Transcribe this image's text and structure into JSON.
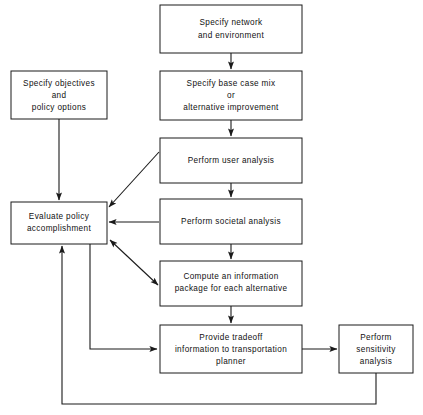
{
  "diagram": {
    "background_color": "#ffffff",
    "line_color": "#1a1a1a",
    "nodes": [
      {
        "id": "specify-network",
        "lines": [
          "Specify network",
          "and environment"
        ],
        "x": 160,
        "y": 5,
        "w": 142,
        "h": 48
      },
      {
        "id": "specify-base-case",
        "lines": [
          "Specify base case mix",
          "or",
          "alternative improvement"
        ],
        "x": 160,
        "y": 71,
        "w": 142,
        "h": 49
      },
      {
        "id": "specify-objectives",
        "lines": [
          "Specify objectives",
          "and",
          "policy options"
        ],
        "x": 11,
        "y": 71,
        "w": 96,
        "h": 48
      },
      {
        "id": "perform-user-analysis",
        "lines": [
          "Perform user analysis"
        ],
        "x": 160,
        "y": 138,
        "w": 142,
        "h": 45
      },
      {
        "id": "evaluate-policy",
        "lines": [
          "Evaluate policy",
          "accomplishment"
        ],
        "x": 11,
        "y": 202,
        "w": 96,
        "h": 42
      },
      {
        "id": "perform-societal-analysis",
        "lines": [
          "Perform societal analysis"
        ],
        "x": 160,
        "y": 199,
        "w": 142,
        "h": 45
      },
      {
        "id": "compute-information-package",
        "lines": [
          "Compute an information",
          "package for each alternative"
        ],
        "x": 160,
        "y": 261,
        "w": 142,
        "h": 45
      },
      {
        "id": "provide-tradeoff",
        "lines": [
          "Provide tradeoff",
          "information to transportation",
          "planner"
        ],
        "x": 160,
        "y": 325,
        "w": 142,
        "h": 48
      },
      {
        "id": "perform-sensitivity-analysis",
        "lines": [
          "Perform",
          "sensitivity",
          "analysis"
        ],
        "x": 339,
        "y": 325,
        "w": 74,
        "h": 48
      }
    ],
    "edges": [
      {
        "id": "network-to-basecase",
        "from": "specify-network",
        "to": "specify-base-case"
      },
      {
        "id": "basecase-to-user",
        "from": "specify-base-case",
        "to": "perform-user-analysis"
      },
      {
        "id": "user-to-societal",
        "from": "perform-user-analysis",
        "to": "perform-societal-analysis"
      },
      {
        "id": "societal-to-compute",
        "from": "perform-societal-analysis",
        "to": "compute-information-package"
      },
      {
        "id": "compute-to-tradeoff",
        "from": "compute-information-package",
        "to": "provide-tradeoff"
      },
      {
        "id": "objectives-to-evaluate",
        "from": "specify-objectives",
        "to": "evaluate-policy"
      },
      {
        "id": "user-to-evaluate",
        "from": "perform-user-analysis",
        "to": "evaluate-policy"
      },
      {
        "id": "societal-to-evaluate",
        "from": "perform-societal-analysis",
        "to": "evaluate-policy"
      },
      {
        "id": "evaluate-to-compute",
        "from": "evaluate-policy",
        "to": "compute-information-package"
      },
      {
        "id": "evaluate-to-tradeoff",
        "from": "evaluate-policy",
        "to": "provide-tradeoff"
      },
      {
        "id": "tradeoff-to-sensitivity",
        "from": "provide-tradeoff",
        "to": "perform-sensitivity-analysis"
      },
      {
        "id": "sensitivity-to-evaluate",
        "from": "perform-sensitivity-analysis",
        "to": "evaluate-policy"
      }
    ]
  }
}
